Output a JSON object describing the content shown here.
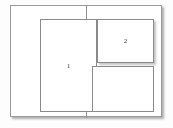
{
  "diagram": {
    "background_color": "#fdfdfd",
    "page": {
      "name": "page-frame",
      "fill_color": "#ffffff",
      "border_color": "#9a9a9a",
      "has_shadow": true
    },
    "divider": {
      "name": "vertical-divider",
      "orientation": "vertical",
      "color": "#8f8f8f"
    },
    "panels": [
      {
        "id": "panel-1",
        "label": "1",
        "position": "left-column",
        "border_color": "#8a8a8a",
        "fill_color": "#ffffff",
        "has_shadow": false
      },
      {
        "id": "panel-2",
        "label": "2",
        "position": "upper-right",
        "border_color": "#8a8a8a",
        "fill_color": "#ffffff",
        "has_shadow": true
      },
      {
        "id": "panel-3",
        "label": "",
        "position": "lower-right",
        "border_color": "#8a8a8a",
        "fill_color": "#ffffff",
        "has_shadow": false
      }
    ]
  }
}
